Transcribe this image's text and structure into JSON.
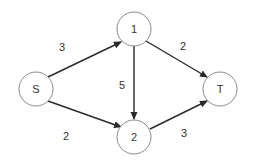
{
  "diagram": {
    "type": "directed-flow-network",
    "colors": {
      "background": "#ffffff",
      "node_stroke": "#8a8a8a",
      "edge": "#2a2a2a",
      "text": "#333333"
    },
    "nodes": [
      {
        "id": "S",
        "label": "S",
        "cx": 36,
        "cy": 89,
        "r": 17
      },
      {
        "id": "1",
        "label": "1",
        "cx": 134,
        "cy": 29,
        "r": 17
      },
      {
        "id": "2",
        "label": "2",
        "cx": 134,
        "cy": 137,
        "r": 17
      },
      {
        "id": "T",
        "label": "T",
        "cx": 220,
        "cy": 89,
        "r": 17
      }
    ],
    "edges": [
      {
        "from": "S",
        "to": "1",
        "weight": "3",
        "x1": 48,
        "y1": 77,
        "x2": 121,
        "y2": 42,
        "lx": 62,
        "ly": 47
      },
      {
        "from": "S",
        "to": "2",
        "weight": "2",
        "x1": 48,
        "y1": 101,
        "x2": 121,
        "y2": 127,
        "lx": 66,
        "ly": 136
      },
      {
        "from": "1",
        "to": "2",
        "weight": "5",
        "x1": 134,
        "y1": 46,
        "x2": 134,
        "y2": 119,
        "lx": 122,
        "ly": 85
      },
      {
        "from": "1",
        "to": "T",
        "weight": "2",
        "x1": 146,
        "y1": 41,
        "x2": 207,
        "y2": 77,
        "lx": 183,
        "ly": 46
      },
      {
        "from": "2",
        "to": "T",
        "weight": "3",
        "x1": 150,
        "y1": 129,
        "x2": 207,
        "y2": 101,
        "lx": 184,
        "ly": 133
      }
    ]
  }
}
